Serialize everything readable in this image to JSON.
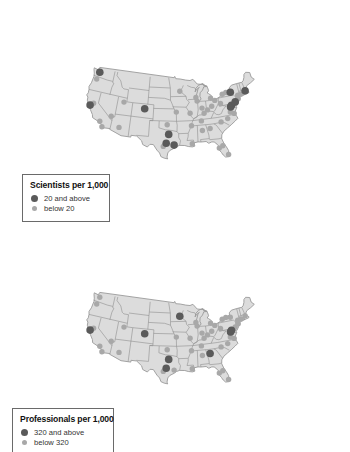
{
  "colors": {
    "land": "#dcdcdc",
    "border": "#8e8e8e",
    "dot_high": "#5a5a5a",
    "dot_low": "#a8a8a8"
  },
  "maps": [
    {
      "id": "scientists",
      "legend": {
        "title": "Scientists per 1,000",
        "high_label": "20 and above",
        "low_label": "below 20"
      },
      "points": [
        {
          "lon": -122.3,
          "lat": 47.6,
          "cat": "high"
        },
        {
          "lon": -122.7,
          "lat": 45.5,
          "cat": "low"
        },
        {
          "lon": -122.4,
          "lat": 37.8,
          "cat": "high"
        },
        {
          "lon": -121.5,
          "lat": 38.6,
          "cat": "low"
        },
        {
          "lon": -111.9,
          "lat": 40.8,
          "cat": "low"
        },
        {
          "lon": -104.9,
          "lat": 39.7,
          "cat": "high"
        },
        {
          "lon": -115.1,
          "lat": 36.2,
          "cat": "low"
        },
        {
          "lon": -118.2,
          "lat": 34.1,
          "cat": "low"
        },
        {
          "lon": -117.2,
          "lat": 32.7,
          "cat": "low"
        },
        {
          "lon": -112.1,
          "lat": 33.5,
          "cat": "low"
        },
        {
          "lon": -93.3,
          "lat": 45.0,
          "cat": "low"
        },
        {
          "lon": -94.6,
          "lat": 39.1,
          "cat": "low"
        },
        {
          "lon": -97.5,
          "lat": 35.5,
          "cat": "low"
        },
        {
          "lon": -97.0,
          "lat": 32.8,
          "cat": "high"
        },
        {
          "lon": -97.7,
          "lat": 30.3,
          "cat": "high"
        },
        {
          "lon": -98.5,
          "lat": 29.4,
          "cat": "low"
        },
        {
          "lon": -95.4,
          "lat": 29.8,
          "cat": "high"
        },
        {
          "lon": -90.1,
          "lat": 30.0,
          "cat": "low"
        },
        {
          "lon": -87.9,
          "lat": 43.0,
          "cat": "low"
        },
        {
          "lon": -87.6,
          "lat": 41.9,
          "cat": "low"
        },
        {
          "lon": -90.2,
          "lat": 38.6,
          "cat": "low"
        },
        {
          "lon": -86.2,
          "lat": 39.8,
          "cat": "low"
        },
        {
          "lon": -85.7,
          "lat": 38.3,
          "cat": "low"
        },
        {
          "lon": -83.0,
          "lat": 42.3,
          "cat": "low"
        },
        {
          "lon": -84.5,
          "lat": 39.1,
          "cat": "low"
        },
        {
          "lon": -83.0,
          "lat": 40.0,
          "cat": "low"
        },
        {
          "lon": -81.7,
          "lat": 41.5,
          "cat": "low"
        },
        {
          "lon": -80.0,
          "lat": 40.4,
          "cat": "low"
        },
        {
          "lon": -86.8,
          "lat": 36.2,
          "cat": "low"
        },
        {
          "lon": -90.0,
          "lat": 35.1,
          "cat": "low"
        },
        {
          "lon": -86.8,
          "lat": 33.5,
          "cat": "low"
        },
        {
          "lon": -84.4,
          "lat": 33.8,
          "cat": "low"
        },
        {
          "lon": -80.8,
          "lat": 35.2,
          "cat": "low"
        },
        {
          "lon": -78.6,
          "lat": 35.8,
          "cat": "low"
        },
        {
          "lon": -77.4,
          "lat": 37.5,
          "cat": "low"
        },
        {
          "lon": -76.3,
          "lat": 36.9,
          "cat": "low"
        },
        {
          "lon": -77.0,
          "lat": 38.9,
          "cat": "high"
        },
        {
          "lon": -76.6,
          "lat": 39.3,
          "cat": "high"
        },
        {
          "lon": -75.2,
          "lat": 40.0,
          "cat": "high"
        },
        {
          "lon": -74.0,
          "lat": 40.7,
          "cat": "low"
        },
        {
          "lon": -73.9,
          "lat": 41.7,
          "cat": "low"
        },
        {
          "lon": -76.1,
          "lat": 43.0,
          "cat": "high"
        },
        {
          "lon": -77.6,
          "lat": 43.2,
          "cat": "low"
        },
        {
          "lon": -78.9,
          "lat": 42.9,
          "cat": "low"
        },
        {
          "lon": -71.1,
          "lat": 42.4,
          "cat": "high"
        },
        {
          "lon": -72.7,
          "lat": 41.8,
          "cat": "low"
        },
        {
          "lon": -82.5,
          "lat": 28.0,
          "cat": "low"
        },
        {
          "lon": -81.4,
          "lat": 28.5,
          "cat": "low"
        },
        {
          "lon": -80.2,
          "lat": 25.8,
          "cat": "low"
        }
      ]
    },
    {
      "id": "professionals",
      "legend": {
        "title": "Professionals per 1,000",
        "high_label": "320 and above",
        "low_label": "below 320"
      },
      "points": [
        {
          "lon": -122.3,
          "lat": 47.6,
          "cat": "low"
        },
        {
          "lon": -122.7,
          "lat": 45.5,
          "cat": "low"
        },
        {
          "lon": -122.4,
          "lat": 37.8,
          "cat": "high"
        },
        {
          "lon": -121.5,
          "lat": 38.6,
          "cat": "low"
        },
        {
          "lon": -111.9,
          "lat": 40.8,
          "cat": "low"
        },
        {
          "lon": -104.9,
          "lat": 39.7,
          "cat": "high"
        },
        {
          "lon": -115.1,
          "lat": 36.2,
          "cat": "low"
        },
        {
          "lon": -118.2,
          "lat": 34.1,
          "cat": "low"
        },
        {
          "lon": -117.2,
          "lat": 32.7,
          "cat": "low"
        },
        {
          "lon": -112.1,
          "lat": 33.5,
          "cat": "low"
        },
        {
          "lon": -93.3,
          "lat": 45.0,
          "cat": "high"
        },
        {
          "lon": -94.6,
          "lat": 39.1,
          "cat": "low"
        },
        {
          "lon": -97.5,
          "lat": 35.5,
          "cat": "low"
        },
        {
          "lon": -97.0,
          "lat": 32.8,
          "cat": "high"
        },
        {
          "lon": -97.7,
          "lat": 30.3,
          "cat": "high"
        },
        {
          "lon": -98.5,
          "lat": 29.4,
          "cat": "low"
        },
        {
          "lon": -95.4,
          "lat": 29.8,
          "cat": "low"
        },
        {
          "lon": -90.1,
          "lat": 30.0,
          "cat": "low"
        },
        {
          "lon": -87.9,
          "lat": 43.0,
          "cat": "low"
        },
        {
          "lon": -87.6,
          "lat": 41.9,
          "cat": "low"
        },
        {
          "lon": -90.2,
          "lat": 38.6,
          "cat": "low"
        },
        {
          "lon": -86.2,
          "lat": 39.8,
          "cat": "low"
        },
        {
          "lon": -85.7,
          "lat": 38.3,
          "cat": "low"
        },
        {
          "lon": -83.0,
          "lat": 42.3,
          "cat": "low"
        },
        {
          "lon": -84.5,
          "lat": 39.1,
          "cat": "low"
        },
        {
          "lon": -83.0,
          "lat": 40.0,
          "cat": "low"
        },
        {
          "lon": -81.7,
          "lat": 41.5,
          "cat": "low"
        },
        {
          "lon": -80.0,
          "lat": 40.4,
          "cat": "low"
        },
        {
          "lon": -86.8,
          "lat": 36.2,
          "cat": "low"
        },
        {
          "lon": -90.0,
          "lat": 35.1,
          "cat": "low"
        },
        {
          "lon": -86.8,
          "lat": 33.5,
          "cat": "low"
        },
        {
          "lon": -84.4,
          "lat": 33.8,
          "cat": "high"
        },
        {
          "lon": -80.8,
          "lat": 35.2,
          "cat": "low"
        },
        {
          "lon": -78.6,
          "lat": 35.8,
          "cat": "low"
        },
        {
          "lon": -77.4,
          "lat": 37.5,
          "cat": "low"
        },
        {
          "lon": -76.3,
          "lat": 36.9,
          "cat": "low"
        },
        {
          "lon": -77.0,
          "lat": 38.9,
          "cat": "high"
        },
        {
          "lon": -76.6,
          "lat": 39.3,
          "cat": "high"
        },
        {
          "lon": -75.2,
          "lat": 40.0,
          "cat": "low"
        },
        {
          "lon": -74.0,
          "lat": 40.7,
          "cat": "low"
        },
        {
          "lon": -73.9,
          "lat": 41.7,
          "cat": "low"
        },
        {
          "lon": -76.1,
          "lat": 43.0,
          "cat": "low"
        },
        {
          "lon": -77.6,
          "lat": 43.2,
          "cat": "low"
        },
        {
          "lon": -78.9,
          "lat": 42.9,
          "cat": "low"
        },
        {
          "lon": -71.1,
          "lat": 42.4,
          "cat": "low"
        },
        {
          "lon": -72.7,
          "lat": 41.8,
          "cat": "low"
        },
        {
          "lon": -82.5,
          "lat": 28.0,
          "cat": "low"
        },
        {
          "lon": -81.4,
          "lat": 28.5,
          "cat": "low"
        },
        {
          "lon": -80.2,
          "lat": 25.8,
          "cat": "low"
        }
      ]
    }
  ]
}
